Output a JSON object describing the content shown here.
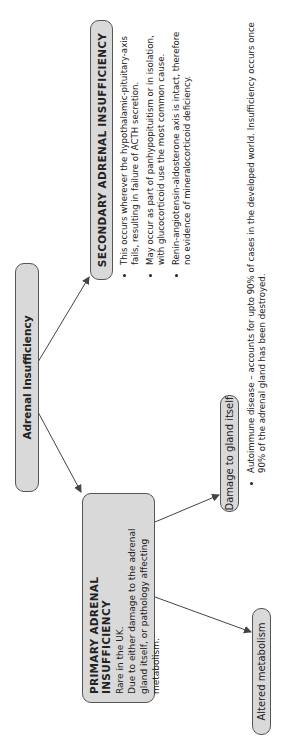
{
  "root": {
    "label": "Adrenal Insufficiency"
  },
  "secondary": {
    "title": "SECONDARY ADRENAL INSUFFICIENCY",
    "bullets": [
      "This occurs wherever the hypothalamic-pituitary-axis fails, resulting in failure of ACTH secretion.",
      "May occur as part of panhypopituitism or in isolation, with glucocorticoid use the most common cause.",
      "Renin-angiotensin-aldosterone axis is intact, therefore no evidence of mineralocorticoid deficiency."
    ]
  },
  "primary": {
    "title": "PRIMARY ADRENAL INSUFFICIENCY",
    "line1": "Rare in the UK.",
    "line2": "Due to either damage to the adrenal gland itself, or pathology affecting metabolism."
  },
  "damage": {
    "label": "Damage to gland itself",
    "bullets": [
      "Autoimmune disease – accounts for upto 90% of cases in the developed world. Insufficiency occurs once 90% of the adrenal gland has been destroyed."
    ]
  },
  "altered": {
    "label": "Altered metabolism"
  },
  "colors": {
    "box_fill": "#d9d9d9",
    "box_border": "#555555",
    "arrow": "#444444"
  }
}
